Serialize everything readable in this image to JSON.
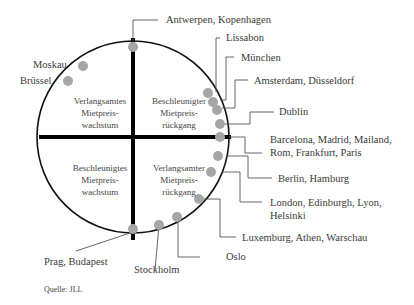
{
  "diagram": {
    "type": "property clock",
    "quadrants": {
      "top_left": "Verlangsamtes Mietpreis- wachstum",
      "top_right": "Beschleunigter Mietpreis- rückgang",
      "bottom_left": "Beschleunigtes Mietpreis- wachstum",
      "bottom_right": "Verlangsamter Mietpreis- rückgang"
    },
    "quadrant_lines": {
      "top_left": [
        "Verlangsamtes",
        "Mietpreis-",
        "wachstum"
      ],
      "top_right": [
        "Beschleunigter",
        "Mietpreis-",
        "rückgang"
      ],
      "bottom_left": [
        "Beschleunigtes",
        "Mietpreis-",
        "wachstum"
      ],
      "bottom_right": [
        "Verlangsamter",
        "Mietpreis-",
        "rückgang"
      ]
    },
    "labels": {
      "moskau": "Moskau",
      "bruessel": "Brüssel",
      "antwerpen": "Antwerpen, Kopenhagen",
      "lissabon": "Lissabon",
      "muenchen": "München",
      "amsterdam": "Amsterdam, Düsseldorf",
      "dublin": "Dublin",
      "barcelona_1": "Barcelona, Madrid, Mailand,",
      "barcelona_2": "Rom, Frankfurt, Paris",
      "berlin": "Berlin, Hamburg",
      "london_1": "London, Edinburgh, Lyon,",
      "london_2": "Helsinki",
      "luxemburg": "Luxemburg, Athen, Warschau",
      "oslo": "Oslo",
      "stockholm": "Stockholm",
      "prag": "Prag, Budapest"
    },
    "source": "Quelle: JLL",
    "colors": {
      "dot": "#a6a6a6",
      "axis": "#000000",
      "circle": "#111111",
      "leader": "#555555"
    }
  }
}
